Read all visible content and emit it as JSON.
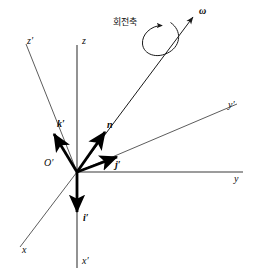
{
  "figure": {
    "background_color": "#ffffff",
    "thin_line_color": "#4a4a4a",
    "bold_vector_color": "#000000",
    "origin": {
      "x": 77,
      "y": 172,
      "label": "O′"
    },
    "axes": [
      {
        "name": "z-axis",
        "label": "z",
        "x1": 77,
        "y1": 45,
        "x2": 77,
        "y2": 172,
        "label_x": 82,
        "label_y": 42
      },
      {
        "name": "z-prime-axis",
        "label": "z′",
        "x1": 26,
        "y1": 44,
        "x2": 77,
        "y2": 172,
        "label_x": 29,
        "label_y": 42
      },
      {
        "name": "y-axis",
        "label": "y",
        "x1": 77,
        "y1": 172,
        "x2": 243,
        "y2": 172,
        "label_x": 236,
        "label_y": 180
      },
      {
        "name": "y-prime-axis",
        "label": "y′",
        "x1": 77,
        "y1": 172,
        "x2": 237,
        "y2": 104,
        "label_x": 229,
        "label_y": 105
      },
      {
        "name": "x-axis",
        "label": "x",
        "x1": 77,
        "y1": 172,
        "x2": 20,
        "y2": 247,
        "label_x": 23,
        "label_y": 252
      },
      {
        "name": "x-prime-axis",
        "label": "x′",
        "x1": 77,
        "y1": 172,
        "x2": 77,
        "y2": 268,
        "label_x": 82,
        "label_y": 262
      }
    ],
    "vectors": [
      {
        "name": "k-prime-vector",
        "label": "k′",
        "x1": 77,
        "y1": 172,
        "x2": 52,
        "y2": 131,
        "label_x": 56,
        "label_y": 124
      },
      {
        "name": "n-vector",
        "label": "n",
        "x1": 77,
        "y1": 172,
        "x2": 107,
        "y2": 129,
        "label_x": 108,
        "label_y": 126
      },
      {
        "name": "j-prime-vector",
        "label": "j′",
        "x1": 77,
        "y1": 172,
        "x2": 120,
        "y2": 155,
        "label_x": 118,
        "label_y": 167
      },
      {
        "name": "i-prime-vector",
        "label": "i′",
        "x1": 77,
        "y1": 172,
        "x2": 77,
        "y2": 216,
        "label_x": 82,
        "label_y": 220
      }
    ],
    "rotation_axis": {
      "name": "rotation-axis-line",
      "x1": 77,
      "y1": 172,
      "x2": 196,
      "y2": 13,
      "omega_label": "ω",
      "omega_label_x": 200,
      "omega_label_y": 12,
      "annotation": "회전축",
      "annotation_x": 115,
      "annotation_y": 23,
      "spin_arrow": {
        "name": "spin-direction-arc",
        "center_x": 162,
        "center_y": 38,
        "rx": 17,
        "ry": 21,
        "rotation_deg": -38
      }
    }
  }
}
